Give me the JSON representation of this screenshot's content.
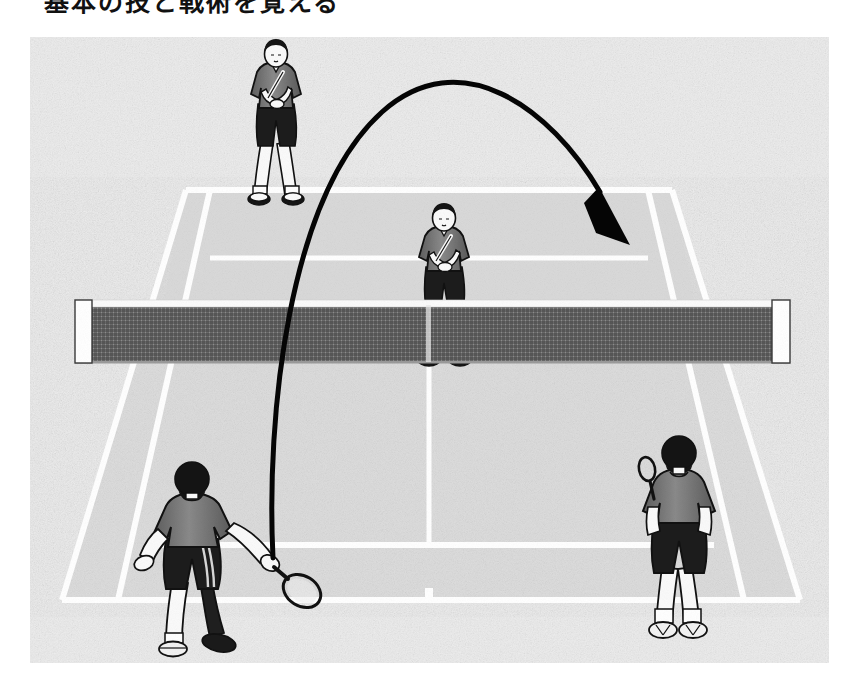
{
  "caption": {
    "text": "基本の技と戦術を覚える"
  },
  "panel": {
    "title": "tennis-doubles-lob-illustration",
    "description": "Black-and-white halftone illustration of a doubles tennis court seen from behind the near baseline, with four players and a curved arrow showing a lob trajectory over the net player into the far court.",
    "frame": {
      "x": 30,
      "y": 37,
      "width": 799,
      "height": 626
    }
  },
  "colors": {
    "background": "#ffffff",
    "court_far": "#d9d9d9",
    "court_near": "#d3d3d3",
    "court_surround": "#e4e4e4",
    "court_line": "#ffffff",
    "net_mesh": "#6f6f6f",
    "net_tape": "#fbfbfb",
    "net_post": "#ffffff",
    "shirt": "#6d6d6d",
    "shorts": "#1c1c1c",
    "skin": "#fafafa",
    "hair": "#141414",
    "outline": "#111111",
    "arrow": "#050505"
  },
  "court": {
    "name": "doubles-tennis-court",
    "surface_label": "hard court",
    "lines": [
      {
        "name": "far-baseline",
        "y": 190
      },
      {
        "name": "far-service-line",
        "y": 258
      },
      {
        "name": "net-line",
        "y": 362
      },
      {
        "name": "near-service-line",
        "y": 545
      },
      {
        "name": "near-baseline",
        "y": 600
      }
    ],
    "center_mark_x": 428,
    "center_service_line_x": 428
  },
  "net": {
    "name": "tennis-net",
    "left_post_x": 75,
    "right_post_x": 790,
    "top_y": 300,
    "bottom_y": 362,
    "mesh_label": "net-mesh",
    "tape_label": "net-tape"
  },
  "players": [
    {
      "id": "far-left-player",
      "label": "Far baseline player",
      "position": "far court, left / behind baseline",
      "facing": "front (toward viewer)",
      "pose": "ready position, racket held across body",
      "x": 247,
      "y": 110
    },
    {
      "id": "far-net-player",
      "label": "Far net player",
      "position": "far court, center / at the net",
      "facing": "front (toward viewer)",
      "pose": "ready position at net, racket held in front",
      "x": 416,
      "y": 277
    },
    {
      "id": "near-left-player",
      "label": "Near hitting player",
      "position": "near court, left side",
      "facing": "back (away from viewer)",
      "pose": "follow-through of a lob stroke, racket extended to the right",
      "x": 185,
      "y": 550
    },
    {
      "id": "near-right-player",
      "label": "Near partner player",
      "position": "near court, right side",
      "facing": "back (away from viewer)",
      "pose": "standing, racket held up by left shoulder",
      "x": 663,
      "y": 540
    }
  ],
  "trajectory": {
    "name": "lob-trajectory-arrow",
    "label": "Lob ball path",
    "shot_type": "lob",
    "start": {
      "x": 273,
      "y": 558
    },
    "apex": {
      "x": 443,
      "y": 92
    },
    "end": {
      "x": 628,
      "y": 238
    },
    "arrowhead": "filled triangle pointing down-right",
    "stroke_width": 5
  }
}
